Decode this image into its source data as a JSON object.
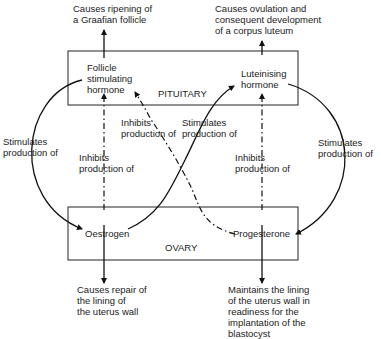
{
  "boxes": {
    "pituitary": "PITUITARY",
    "ovary": "OVARY"
  },
  "hormones": {
    "fsh": "Follicle\nstimulating\nhormone",
    "lh": "Luteinising\nhormone",
    "oestrogen": "Oestrogen",
    "progesterone": "Progesterone"
  },
  "effects": {
    "fsh_effect": "Causes ripening of\na Graafian follicle",
    "lh_effect": "Causes ovulation and\nconsequent development\nof a corpus luteum",
    "oestrogen_effect": "Causes repair of\nthe lining of\nthe uterus wall",
    "progesterone_effect": "Maintains the lining\nof the uterus wall in\nreadiness for the\nimplantation of the\nblastocyst"
  },
  "relations": {
    "fsh_stimulates_oestrogen": "Stimulates\nproduction of",
    "oestrogen_inhibits_fsh": "Inhibits\nproduction of",
    "progesterone_inhibits_fsh": "Inhibits\nproduction of",
    "oestrogen_stimulates_lh": "Stimulates\nproduction of",
    "progesterone_inhibits_lh": "Inhibits\nproduction of",
    "lh_stimulates_progesterone": "Stimulates\nproduction of"
  }
}
